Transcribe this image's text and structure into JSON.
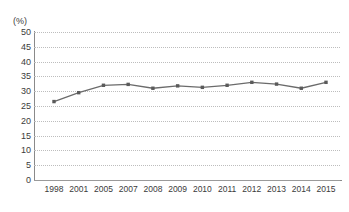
{
  "chart_data": {
    "type": "line",
    "title": "",
    "subtitle": "",
    "xlabel": "",
    "ylabel": "",
    "unit_label": "(%)",
    "categories": [
      "1998",
      "2001",
      "2005",
      "2007",
      "2008",
      "2009",
      "2010",
      "2011",
      "2012",
      "2013",
      "2014",
      "2015"
    ],
    "values": [
      26.5,
      29.5,
      32.0,
      32.3,
      31.0,
      31.8,
      31.3,
      32.0,
      33.0,
      32.4,
      31.0,
      33.0
    ],
    "series": [
      {
        "name": "",
        "values": [
          26.5,
          29.5,
          32.0,
          32.3,
          31.0,
          31.8,
          31.3,
          32.0,
          33.0,
          32.4,
          31.0,
          33.0
        ]
      }
    ],
    "ylim": [
      0,
      50
    ],
    "yticks": [
      0,
      5,
      10,
      15,
      20,
      25,
      30,
      35,
      40,
      45,
      50
    ],
    "ytick_labels": [
      "0",
      "5",
      "10",
      "15",
      "20",
      "25",
      "30",
      "35",
      "40",
      "45",
      "50"
    ],
    "grid": true,
    "grid_style": "dotted-horizontal",
    "legend": false,
    "legend_position": "none",
    "marker": "square",
    "line_color": "#6b6b6b",
    "marker_color": "#5a5a5a",
    "grid_color": "#bdbdbd",
    "axis_color": "#8a8a8a",
    "text_color": "#3b3b3b",
    "background": "#ffffff",
    "annotations": []
  }
}
